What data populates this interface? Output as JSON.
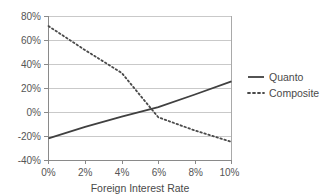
{
  "chart_data": {
    "type": "line",
    "title": "",
    "xlabel": "Foreign Interest Rate",
    "ylabel": "",
    "xlim": [
      0,
      10
    ],
    "ylim": [
      -40,
      80
    ],
    "grid": true,
    "legend_position": "right",
    "x": [
      0,
      2,
      4,
      6,
      8,
      10
    ],
    "xticklabels": [
      "0%",
      "2%",
      "4%",
      "6%",
      "8%",
      "10%"
    ],
    "yticks": [
      -40,
      -20,
      0,
      20,
      40,
      60,
      80
    ],
    "yticklabels": [
      "-40%",
      "-20%",
      "0%",
      "20%",
      "40%",
      "60%",
      "80%"
    ],
    "series": [
      {
        "name": "Quanto",
        "style": "solid",
        "color": "#404040",
        "values": [
          -21.5,
          -12.0,
          -3.5,
          4.5,
          15.0,
          26.0
        ]
      },
      {
        "name": "Composite",
        "style": "dotted",
        "color": "#4a4a4a",
        "values": [
          72.0,
          52.0,
          33.0,
          -4.0,
          -15.0,
          -24.5
        ]
      }
    ],
    "crossover": {
      "x": 5.4,
      "y": 1.0
    }
  },
  "axes": {
    "x_title": "Foreign Interest Rate",
    "x_ticks": [
      "0%",
      "2%",
      "4%",
      "6%",
      "8%",
      "10%"
    ],
    "y_ticks": [
      "80%",
      "60%",
      "40%",
      "20%",
      "0%",
      "-20%",
      "-40%"
    ]
  },
  "legend": {
    "items": [
      {
        "label": "Quanto",
        "style": "solid"
      },
      {
        "label": "Composite",
        "style": "dotted"
      }
    ]
  },
  "colors": {
    "line": "#404040",
    "grid": "#c9c9c9",
    "axis": "#8a8a8a",
    "text": "#555555",
    "background": "#ffffff"
  }
}
